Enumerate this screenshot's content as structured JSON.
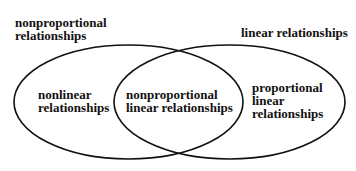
{
  "diagram": {
    "type": "venn",
    "stroke_color": "#111111",
    "background": "#ffffff",
    "sets": [
      {
        "id": "nonproportional",
        "title": [
          "nonproportional",
          "relationships"
        ]
      },
      {
        "id": "linear",
        "title": [
          "linear relationships"
        ]
      }
    ],
    "regions": {
      "left_only": [
        "nonlinear",
        "relationships"
      ],
      "intersection": [
        "nonproportional",
        "linear relationships"
      ],
      "right_only": [
        "proportional",
        "linear",
        "relationships"
      ]
    }
  }
}
